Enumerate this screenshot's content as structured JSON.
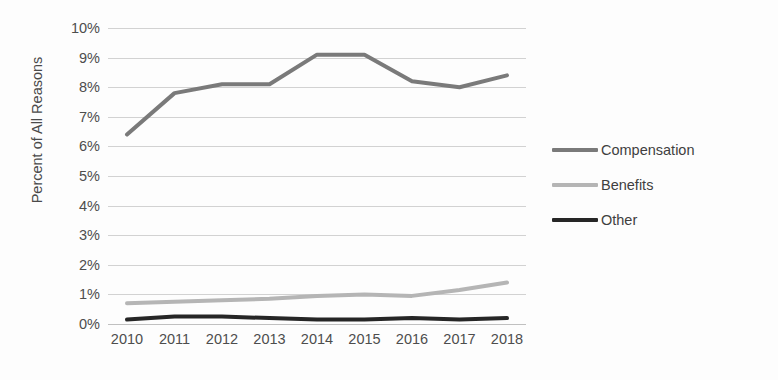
{
  "chart_data": {
    "type": "line",
    "title": "",
    "xlabel": "",
    "ylabel": "Percent of All Reasons",
    "x": [
      2010,
      2011,
      2012,
      2013,
      2014,
      2015,
      2016,
      2017,
      2018
    ],
    "categories": [
      "2010",
      "2011",
      "2012",
      "2013",
      "2014",
      "2015",
      "2016",
      "2017",
      "2018"
    ],
    "ylim": [
      0,
      10
    ],
    "ytick_values": [
      0,
      1,
      2,
      3,
      4,
      5,
      6,
      7,
      8,
      9,
      10
    ],
    "ytick_labels": [
      "0%",
      "1%",
      "2%",
      "3%",
      "4%",
      "5%",
      "6%",
      "7%",
      "8%",
      "9%",
      "10%"
    ],
    "grid": true,
    "legend_position": "right",
    "series": [
      {
        "name": "Compensation",
        "color": "#7a7a7a",
        "values": [
          6.4,
          7.8,
          8.1,
          8.1,
          9.1,
          9.1,
          8.2,
          8.0,
          8.4
        ]
      },
      {
        "name": "Benefits",
        "color": "#b5b5b5",
        "values": [
          0.7,
          0.75,
          0.8,
          0.85,
          0.95,
          1.0,
          0.95,
          1.15,
          1.4
        ]
      },
      {
        "name": "Other",
        "color": "#262626",
        "values": [
          0.15,
          0.25,
          0.25,
          0.2,
          0.15,
          0.15,
          0.2,
          0.15,
          0.2
        ]
      }
    ]
  },
  "axis": {
    "y_title": "Percent of All Reasons"
  },
  "legend": {
    "items": [
      {
        "label": "Compensation",
        "color": "#7a7a7a"
      },
      {
        "label": "Benefits",
        "color": "#b5b5b5"
      },
      {
        "label": "Other",
        "color": "#262626"
      }
    ]
  }
}
